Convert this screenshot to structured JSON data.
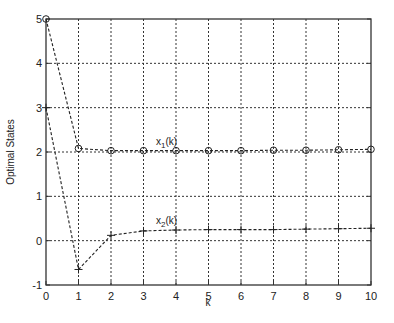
{
  "chart_data": {
    "type": "line",
    "title": "",
    "xlabel": "k",
    "ylabel": "Optimal States",
    "xlim": [
      0,
      10
    ],
    "ylim": [
      -1,
      5
    ],
    "xticks": [
      "0",
      "1",
      "2",
      "3",
      "4",
      "5",
      "6",
      "7",
      "8",
      "9",
      "10"
    ],
    "yticks": [
      "-1",
      "0",
      "1",
      "2",
      "3",
      "4",
      "5"
    ],
    "grid": true,
    "legend": null,
    "x": [
      0,
      1,
      2,
      3,
      4,
      5,
      6,
      7,
      8,
      9,
      10
    ],
    "series": [
      {
        "name": "x1(k)",
        "marker": "circle",
        "values": [
          5,
          2.08,
          2.03,
          2.03,
          2.03,
          2.03,
          2.03,
          2.04,
          2.04,
          2.05,
          2.06
        ]
      },
      {
        "name": "x2(k)",
        "marker": "plus",
        "values": [
          3,
          -0.65,
          0.12,
          0.22,
          0.24,
          0.25,
          0.25,
          0.25,
          0.26,
          0.27,
          0.28
        ]
      }
    ],
    "annotations": [
      {
        "text": "x1(k)",
        "x": 4,
        "y": 2.1
      },
      {
        "text": "x2(k)",
        "x": 4,
        "y": 0.3
      }
    ]
  }
}
